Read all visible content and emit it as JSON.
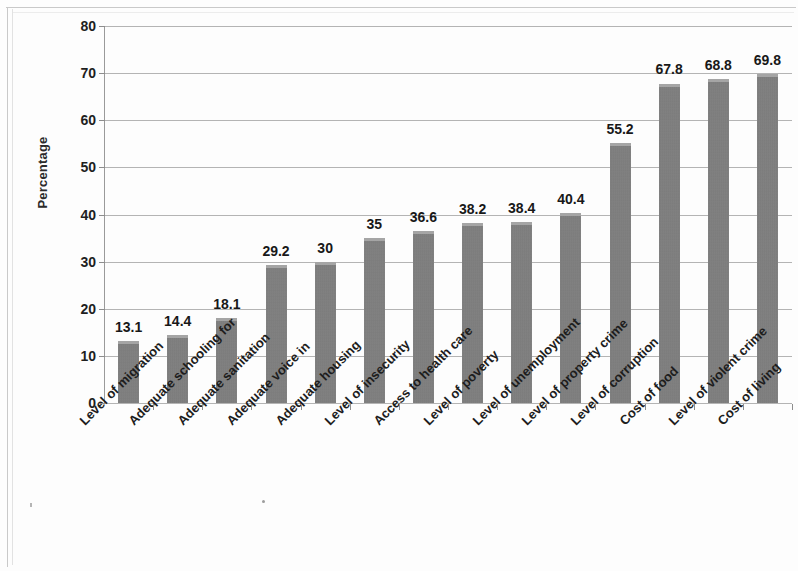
{
  "chart_data": {
    "type": "bar",
    "title": "",
    "xlabel": "",
    "ylabel": "Percentage",
    "ylim": [
      0,
      80
    ],
    "ytick_step": 10,
    "grid": true,
    "legend": "none",
    "bar_color": "#7b7b7b",
    "categories": [
      "Level of migration",
      "Adequate schooling for",
      "Adequate sanitation",
      "Adequate voice in",
      "Adequate housing",
      "Level of insecurity",
      "Access to health care",
      "Level of poverty",
      "Level of unemployment",
      "Level of property crime",
      "Level of corruption",
      "Cost of food",
      "Level of violent crime",
      "Cost of living"
    ],
    "values": [
      13.1,
      14.4,
      18.1,
      29.2,
      30,
      35,
      36.6,
      38.2,
      38.4,
      40.4,
      55.2,
      67.8,
      68.8,
      69.8
    ],
    "value_labels": [
      "13.1",
      "14.4",
      "18.1",
      "29.2",
      "30",
      "35",
      "36.6",
      "38.2",
      "38.4",
      "40.4",
      "55.2",
      "67.8",
      "68.8",
      "69.8"
    ],
    "ytick_labels": [
      "80",
      "70",
      "60",
      "50",
      "40",
      "30",
      "20",
      "10",
      "0"
    ]
  }
}
